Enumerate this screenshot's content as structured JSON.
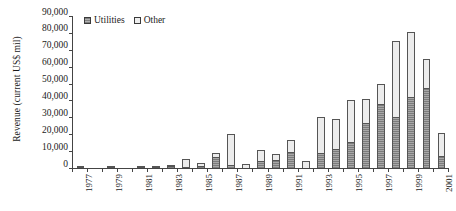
{
  "chart_data": {
    "type": "bar",
    "stacked": true,
    "title": "",
    "xlabel": "",
    "ylabel": "Revenue (current US$ mil)",
    "ylim": [
      0,
      90000
    ],
    "ytick_labels": [
      "90,000",
      "80,000",
      "70,000",
      "60,000",
      "50,000",
      "40,000",
      "30,000",
      "20,000",
      "10,000",
      "0"
    ],
    "ytick_values": [
      90000,
      80000,
      70000,
      60000,
      50000,
      40000,
      30000,
      20000,
      10000,
      0
    ],
    "grid": false,
    "legend_position": "top-left",
    "categories": [
      "1977",
      "1978",
      "1979",
      "1980",
      "1981",
      "1982",
      "1983",
      "1984",
      "1985",
      "1986",
      "1987",
      "1988",
      "1989",
      "1990",
      "1991",
      "1992",
      "1993",
      "1994",
      "1995",
      "1996",
      "1997",
      "1998",
      "1999",
      "2000",
      "2001"
    ],
    "xtick_labels_shown": [
      "1977",
      "1979",
      "1981",
      "1983",
      "1985",
      "1987",
      "1989",
      "1991",
      "1993",
      "1995",
      "1997",
      "1999",
      "2001"
    ],
    "series": [
      {
        "name": "Utilities",
        "color": "#a8a8a8",
        "values": [
          600,
          0,
          200,
          0,
          300,
          400,
          1100,
          800,
          1300,
          6400,
          1500,
          0,
          4200,
          4700,
          9500,
          0,
          8900,
          11000,
          15500,
          26500,
          38000,
          30500,
          42000,
          47500,
          7000
        ]
      },
      {
        "name": "Other",
        "color": "#ececec",
        "values": [
          300,
          0,
          200,
          0,
          300,
          300,
          700,
          4500,
          1400,
          2300,
          18500,
          2300,
          6200,
          3600,
          7100,
          4300,
          21500,
          18000,
          24500,
          14500,
          12000,
          44500,
          38500,
          17000,
          13500
        ]
      }
    ]
  },
  "legend": {
    "items": [
      {
        "label": "Utilities",
        "swatch": "utilities"
      },
      {
        "label": "Other",
        "swatch": "other"
      }
    ]
  }
}
